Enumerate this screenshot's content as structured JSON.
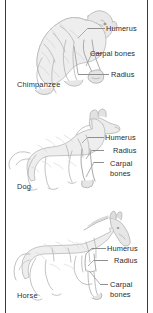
{
  "figure": {
    "bone_labels": [
      "Humerus",
      "Carpal bones",
      "Radius"
    ],
    "line_color": "#8e8e8e",
    "text_color": "#2b2b2b",
    "sketch_color": "#b9b9b9",
    "background": "#ffffff"
  },
  "panels": [
    {
      "id": "chimpanzee",
      "caption": "Chimpanzee",
      "animal_icon": "chimpanzee-sketch",
      "labels": [
        {
          "text": "Humerus",
          "name": "humerus"
        },
        {
          "text": "Carpal bones",
          "name": "carpal-bones"
        },
        {
          "text": "Radius",
          "name": "radius"
        }
      ]
    },
    {
      "id": "dog",
      "caption": "Dog",
      "animal_icon": "dog-sketch",
      "labels": [
        {
          "text": "Humerus",
          "name": "humerus"
        },
        {
          "text": "Radius",
          "name": "radius"
        },
        {
          "text": "Carpal",
          "name": "carpal-line1"
        },
        {
          "text": "bones",
          "name": "carpal-line2"
        }
      ]
    },
    {
      "id": "horse",
      "caption": "Horse",
      "animal_icon": "horse-sketch",
      "labels": [
        {
          "text": "Humerus",
          "name": "humerus"
        },
        {
          "text": "Radius",
          "name": "radius"
        },
        {
          "text": "Carpal",
          "name": "carpal-line1"
        },
        {
          "text": "bones",
          "name": "carpal-line2"
        }
      ]
    }
  ]
}
